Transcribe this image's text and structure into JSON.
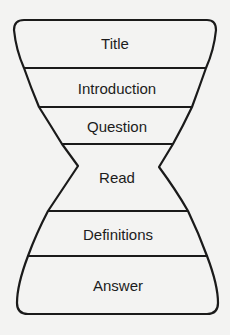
{
  "diagram": {
    "type": "hourglass-structure",
    "sections": [
      {
        "label": "Title"
      },
      {
        "label": "Introduction"
      },
      {
        "label": "Question"
      },
      {
        "label": "Read"
      },
      {
        "label": "Definitions"
      },
      {
        "label": "Answer"
      }
    ],
    "colors": {
      "stroke": "#1a1a1a",
      "background": "#f3f3f2",
      "text": "#1c1c1c"
    }
  }
}
